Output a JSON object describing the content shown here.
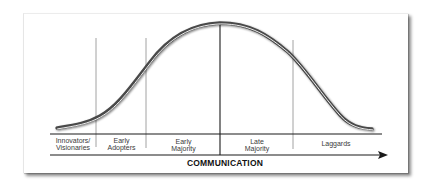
{
  "diagram": {
    "type": "diffusion-of-innovation bell curve",
    "axis_label": "COMMUNICATION",
    "segments": [
      {
        "line1": "Innovators/",
        "line2": "Visionaries"
      },
      {
        "line1": "Early",
        "line2": "Adopters"
      },
      {
        "line1": "Early",
        "line2": "Majority"
      },
      {
        "line1": "Late",
        "line2": "Majority"
      },
      {
        "line1": "Laggards",
        "line2": ""
      }
    ],
    "colors": {
      "curve": "#4a4a4a",
      "lines": "#1a1a1a",
      "dividers": "#8a8a8a",
      "text": "#3a3a3a"
    }
  }
}
